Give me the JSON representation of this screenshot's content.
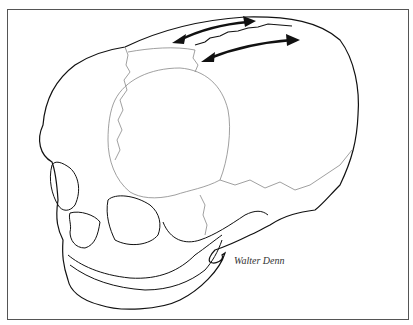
{
  "illustration": {
    "subject": "infant-skull-lateral-view",
    "signature": "Walter Denn",
    "arrows": [
      {
        "name": "upper-double-arrow",
        "direction": "bidirectional"
      },
      {
        "name": "lower-double-arrow",
        "direction": "bidirectional"
      }
    ],
    "colors": {
      "outline": "#111111",
      "suture": "#888888",
      "frame": "#555555",
      "background": "#ffffff"
    }
  }
}
